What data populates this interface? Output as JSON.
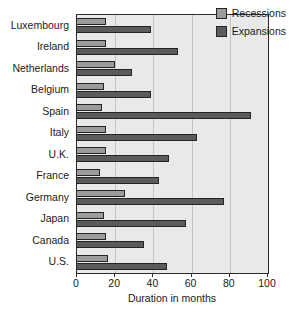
{
  "chart_data": {
    "type": "bar",
    "orientation": "horizontal",
    "title": "",
    "xlabel": "Duration in months",
    "ylabel": "",
    "xlim": [
      0,
      100
    ],
    "xticks": [
      0,
      20,
      40,
      60,
      80,
      100
    ],
    "xticklabels": [
      "0",
      "20",
      "40",
      "60",
      "80",
      "100"
    ],
    "grid": "vertical",
    "legend_position": "top-right-inside",
    "categories": [
      "Luxembourg",
      "Ireland",
      "Netherlands",
      "Belgium",
      "Spain",
      "Italy",
      "U.K.",
      "France",
      "Germany",
      "Japan",
      "Canada",
      "U.S."
    ],
    "series": [
      {
        "name": "Recessions",
        "color": "#9b9b9b",
        "values": [
          15,
          15,
          20,
          14,
          13,
          15,
          15,
          12,
          25,
          14,
          15,
          16
        ]
      },
      {
        "name": "Expansions",
        "color": "#5b5b5b",
        "values": [
          39,
          53,
          29,
          39,
          91,
          63,
          48,
          43,
          77,
          57,
          35,
          47
        ]
      }
    ]
  },
  "legend": {
    "entries": [
      {
        "label": "Recessions"
      },
      {
        "label": "Expansions"
      }
    ]
  },
  "colors": {
    "recession": "#9b9b9b",
    "expansion": "#5b5b5b",
    "plot_background": "#e9e9e9",
    "gridline": "#c4c4c4",
    "axis": "#2b2b2b",
    "text": "#1a1a1a",
    "figure_background": "#ffffff"
  }
}
